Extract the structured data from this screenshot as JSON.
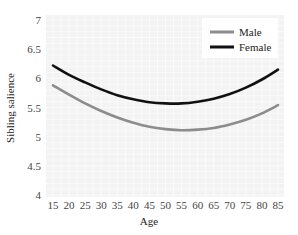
{
  "chart_data": {
    "type": "line",
    "title": "",
    "xlabel": "Age",
    "ylabel": "Sibling salience",
    "x": [
      15,
      20,
      25,
      30,
      35,
      40,
      45,
      50,
      55,
      60,
      65,
      70,
      75,
      80,
      85
    ],
    "xlim": [
      15,
      85
    ],
    "ylim": [
      4,
      7
    ],
    "yticks": [
      4,
      4.5,
      5,
      5.5,
      6,
      6.5,
      7
    ],
    "xticks": [
      15,
      20,
      25,
      30,
      35,
      40,
      45,
      50,
      55,
      60,
      65,
      70,
      75,
      80,
      85
    ],
    "grid": true,
    "legend_position": "upper right",
    "series": [
      {
        "name": "Male",
        "color": "#8c8c8c",
        "values": [
          5.88,
          5.72,
          5.57,
          5.44,
          5.33,
          5.24,
          5.17,
          5.13,
          5.11,
          5.12,
          5.15,
          5.21,
          5.29,
          5.4,
          5.54
        ]
      },
      {
        "name": "Female",
        "color": "#111111",
        "values": [
          6.22,
          6.06,
          5.93,
          5.81,
          5.71,
          5.64,
          5.59,
          5.57,
          5.57,
          5.6,
          5.65,
          5.73,
          5.84,
          5.98,
          6.15
        ]
      }
    ]
  },
  "axes": {
    "ylabel": "Sibling salience",
    "xlabel": "Age",
    "ytick_labels": [
      "7",
      "6.5",
      "6",
      "5.5",
      "5",
      "4.5",
      "4"
    ],
    "xtick_labels": [
      "15",
      "20",
      "25",
      "30",
      "35",
      "40",
      "45",
      "50",
      "55",
      "60",
      "65",
      "70",
      "75",
      "80",
      "85"
    ]
  },
  "legend": {
    "items": [
      {
        "label": "Male",
        "color": "#8c8c8c"
      },
      {
        "label": "Female",
        "color": "#111111"
      }
    ]
  },
  "colors": {
    "plot_background": "#f3f3f3",
    "grid": "#ffffff"
  }
}
